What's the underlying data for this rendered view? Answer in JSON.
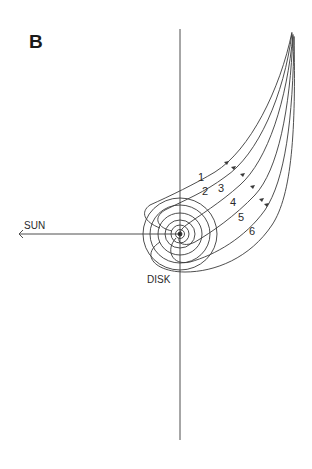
{
  "panel_label": "B",
  "labels": {
    "sun": "SUN",
    "disk": "DISK"
  },
  "streamlines": [
    {
      "id": "1",
      "label": "1"
    },
    {
      "id": "2",
      "label": "2"
    },
    {
      "id": "3",
      "label": "3"
    },
    {
      "id": "4",
      "label": "4"
    },
    {
      "id": "5",
      "label": "5"
    },
    {
      "id": "6",
      "label": "6"
    }
  ],
  "colors": {
    "line": "#3a3a3a",
    "background": "#ffffff"
  }
}
